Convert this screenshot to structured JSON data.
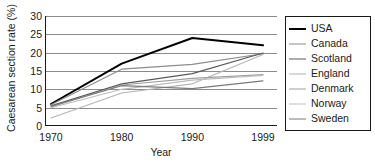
{
  "chart_data": {
    "type": "line",
    "title": "",
    "xlabel": "Year",
    "ylabel": "Caesarean section rate (%)",
    "categories": [
      "1970",
      "1980",
      "1990",
      "1999"
    ],
    "x_tick_labels": [
      "1970",
      "1980",
      "1990",
      "1999"
    ],
    "y_tick_labels": [
      "0",
      "5",
      "10",
      "15",
      "20",
      "25",
      "30"
    ],
    "y_ticks": [
      0,
      5,
      10,
      15,
      20,
      25,
      30
    ],
    "ylim": [
      0,
      30
    ],
    "grid": "horizontal",
    "legend_position": "right-outside",
    "series": [
      {
        "name": "USA",
        "values": [
          6.0,
          17.0,
          24.0,
          22.0
        ],
        "color": "#000000",
        "width": 2.0
      },
      {
        "name": "Canada",
        "values": [
          5.8,
          15.5,
          16.8,
          19.7
        ],
        "color": "#8c8c8c",
        "width": 1.1
      },
      {
        "name": "Scotland",
        "values": [
          5.5,
          11.5,
          14.3,
          19.9
        ],
        "color": "#5a5a5a",
        "width": 1.2
      },
      {
        "name": "England",
        "values": [
          2.2,
          9.0,
          11.5,
          19.5
        ],
        "color": "#b4b4b4",
        "width": 1.1
      },
      {
        "name": "Denmark",
        "values": [
          5.2,
          11.2,
          13.0,
          14.0
        ],
        "color": "#a0a0a0",
        "width": 1.1
      },
      {
        "name": "Norway",
        "values": [
          5.0,
          10.0,
          12.5,
          13.8
        ],
        "color": "#bdbdbd",
        "width": 1.1
      },
      {
        "name": "Sweden",
        "values": [
          5.4,
          11.0,
          10.2,
          12.3
        ],
        "color": "#7a7a7a",
        "width": 1.1
      }
    ]
  }
}
